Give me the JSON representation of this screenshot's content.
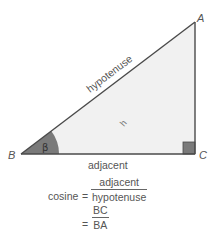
{
  "diagram": {
    "type": "right-triangle",
    "vertices": {
      "A": {
        "label": "A",
        "x": 195,
        "y": 22
      },
      "B": {
        "label": "B",
        "x": 21,
        "y": 154
      },
      "C": {
        "label": "C",
        "x": 195,
        "y": 154
      }
    },
    "sides": {
      "hypotenuse": "hypotenuse",
      "adjacent": "adjacent"
    },
    "angle_label": "β",
    "interior_label": "h",
    "colors": {
      "triangle_fill": "#f1f1f1",
      "stroke": "#4a4a4a",
      "angle_fill": "#7a7a7a",
      "right_angle_fill": "#7a7a7a",
      "text": "#555555"
    }
  },
  "formula": {
    "function": "cosine",
    "equals": "=",
    "line1": {
      "numerator": "adjacent",
      "denominator": "hypotenuse"
    },
    "line2": {
      "numerator": "BC",
      "denominator": "BA"
    }
  }
}
